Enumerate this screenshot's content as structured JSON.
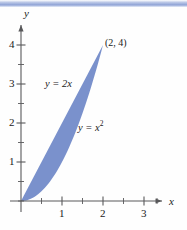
{
  "figure": {
    "background_color": "#fefefe",
    "top_band_color": "#8fa3d6",
    "region_fill_color": "#6f88c8",
    "axis_color": "#58585a"
  },
  "axes": {
    "x_axis_label": "x",
    "y_axis_label": "y",
    "x_ticks_major": [
      {
        "value": 1,
        "label": "1"
      },
      {
        "value": 2,
        "label": "2"
      },
      {
        "value": 3,
        "label": "3"
      }
    ],
    "x_ticks_minor": [
      0.5,
      1.5,
      2.5,
      3.5
    ],
    "y_ticks_major": [
      {
        "value": 1,
        "label": "1"
      },
      {
        "value": 2,
        "label": "2"
      },
      {
        "value": 3,
        "label": "3"
      },
      {
        "value": 4,
        "label": "4"
      }
    ],
    "y_ticks_minor": [
      0.5,
      1.5,
      2.5,
      3.5
    ],
    "xlim": [
      -0.15,
      3.95
    ],
    "ylim": [
      -0.2,
      4.3
    ]
  },
  "chart_data": {
    "type": "line",
    "title": "",
    "xlabel": "x",
    "ylabel": "y",
    "xlim": [
      -0.15,
      3.95
    ],
    "ylim": [
      -0.2,
      4.3
    ],
    "grid": false,
    "legend": "none",
    "series": [
      {
        "name": "y = 2x",
        "equation": "y = 2x",
        "label": "y = 2x",
        "x": [
          0,
          0.25,
          0.5,
          0.75,
          1,
          1.25,
          1.5,
          1.75,
          2
        ],
        "y": [
          0,
          0.5,
          1,
          1.5,
          2,
          2.5,
          3,
          3.5,
          4
        ]
      },
      {
        "name": "y = x^2",
        "equation": "y = x²",
        "label": "y = x",
        "label_exponent": "2",
        "x": [
          0,
          0.25,
          0.5,
          0.75,
          1,
          1.25,
          1.5,
          1.75,
          2
        ],
        "y": [
          0,
          0.0625,
          0.25,
          0.5625,
          1,
          1.5625,
          2.25,
          3.0625,
          4
        ]
      }
    ],
    "shaded_region": {
      "description": "Region bounded above by y = 2x and below by y = x^2 between x = 0 and x = 2",
      "x_from": 0,
      "x_to": 2,
      "upper_curve": "y = 2x",
      "lower_curve": "y = x^2",
      "fill_color": "#6f88c8"
    },
    "annotations": [
      {
        "text": "(2, 4)",
        "x": 2,
        "y": 4
      }
    ],
    "intersection_points": [
      {
        "x": 0,
        "y": 0
      },
      {
        "x": 2,
        "y": 4
      }
    ]
  },
  "labels": {
    "point_2_4": "(2, 4)",
    "line_label": "y = 2x",
    "parabola_label_base": "y = x",
    "parabola_label_exp": "2"
  }
}
